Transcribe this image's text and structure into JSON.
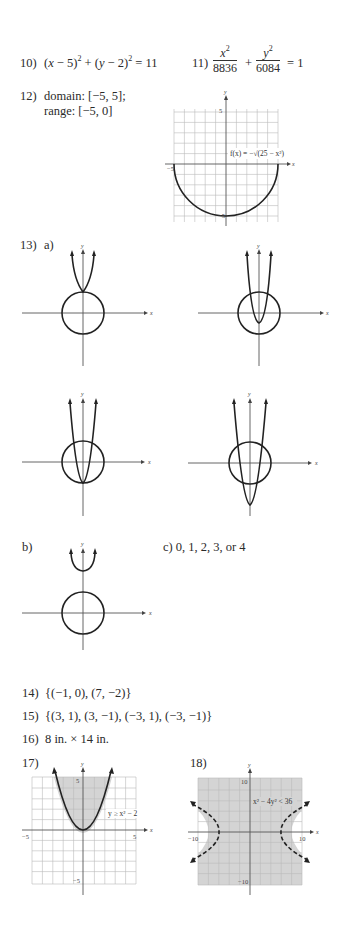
{
  "problems": {
    "p10": {
      "label": "10)",
      "answer_html": "(x − 5)² + (y − 2)² = 11"
    },
    "p11": {
      "label": "11)",
      "num1": "x²",
      "den1": "8836",
      "plus": "+",
      "num2": "y²",
      "den2": "6084",
      "rhs": "= 1"
    },
    "p12": {
      "label": "12)",
      "line1": "domain: [−5, 5];",
      "line2": "range: [−5, 0]",
      "graph": {
        "func_label": "f(x) = −√(25 − x²)",
        "y_tick_top": "5",
        "y_tick_bottom": "−5",
        "x_tick_left": "−5",
        "x_tick_right": "5",
        "x_axis": "x",
        "y_axis": "y"
      }
    },
    "p13": {
      "label": "13)",
      "part_a": "a)",
      "part_b": "b)",
      "part_c": "c) 0, 1, 2, 3, or 4",
      "axis_x": "x",
      "axis_y": "y"
    },
    "p14": {
      "label": "14)",
      "answer": "{(−1, 0), (7, −2)}"
    },
    "p15": {
      "label": "15)",
      "answer": "{(3, 1), (3, −1), (−3, 1), (−3, −1)}"
    },
    "p16": {
      "label": "16)",
      "answer": "8 in. × 14 in."
    },
    "p17": {
      "label": "17)",
      "inequality": "y ≥ x² − 2",
      "x_min": "−5",
      "x_max": "5",
      "y_max": "5",
      "y_min": "−5",
      "x_axis": "x",
      "y_axis": "y"
    },
    "p18": {
      "label": "18)",
      "inequality": "x² − 4y² < 36",
      "x_min": "−10",
      "x_max": "10",
      "y_max": "10",
      "y_min": "−10",
      "x_axis": "x",
      "y_axis": "y"
    }
  },
  "colors": {
    "shade": "#d4d4d4",
    "grid": "#bbbbbb",
    "curve": "#222222",
    "text": "#2a2a2a"
  }
}
